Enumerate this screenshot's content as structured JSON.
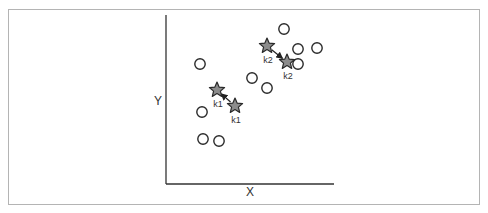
{
  "diagram": {
    "type": "kmeans-centroid-update",
    "axes": {
      "x_label": "X",
      "y_label": "Y"
    },
    "colors": {
      "axis": "#333333",
      "point_stroke": "#2a2a2a",
      "point_fill": "#ffffff",
      "centroid_fill": "#8c8c8c",
      "centroid_stroke": "#2a2a2a",
      "frame": "#b4b4b4"
    },
    "points": [
      {
        "x": 284,
        "y": 29
      },
      {
        "x": 298,
        "y": 49
      },
      {
        "x": 317,
        "y": 48
      },
      {
        "x": 298,
        "y": 64
      },
      {
        "x": 200,
        "y": 64
      },
      {
        "x": 252,
        "y": 78
      },
      {
        "x": 267,
        "y": 88
      },
      {
        "x": 202,
        "y": 112
      },
      {
        "x": 203,
        "y": 139
      },
      {
        "x": 219,
        "y": 141
      }
    ],
    "centroids": [
      {
        "id": "k1-a",
        "label": "k1",
        "x": 217,
        "y": 90
      },
      {
        "id": "k1-b",
        "label": "k1",
        "x": 235,
        "y": 106
      },
      {
        "id": "k2-a",
        "label": "k2",
        "x": 267,
        "y": 46
      },
      {
        "id": "k2-b",
        "label": "k2",
        "x": 287,
        "y": 62
      }
    ],
    "moves": [
      {
        "label": "k1",
        "from": "k1-b",
        "to": "k1-a"
      },
      {
        "label": "k2",
        "from": "k2-a",
        "to": "k2-b"
      }
    ]
  }
}
